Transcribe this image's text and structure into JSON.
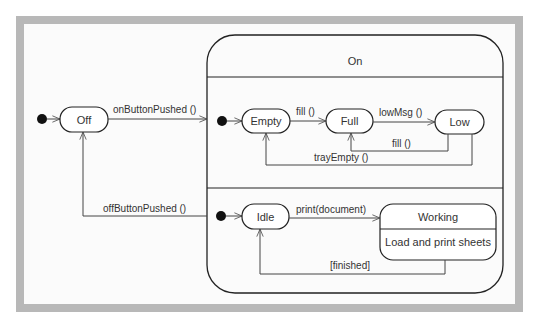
{
  "diagram": {
    "type": "uml-state-machine",
    "colors": {
      "frame": "#b8b8b8",
      "background": "#fbfbfb",
      "stroke": "#222222",
      "text": "#333333"
    },
    "top_level": {
      "initial_to": "Off",
      "states": {
        "off": "Off",
        "on": "On"
      }
    },
    "on_region_1": {
      "states": {
        "empty": "Empty",
        "full": "Full",
        "low": "Low"
      }
    },
    "on_region_2": {
      "states": {
        "idle": "Idle",
        "working": "Working",
        "working_activity": "Load and print sheets"
      }
    },
    "transitions": {
      "on_button_pushed": "onButtonPushed ()",
      "off_button_pushed": "offButtonPushed ()",
      "fill_empty_full": "fill ()",
      "low_msg": "lowMsg ()",
      "fill_low_full": "fill ()",
      "tray_empty": "trayEmpty ()",
      "print_document": "print(document)",
      "finished": "[finished]"
    }
  }
}
